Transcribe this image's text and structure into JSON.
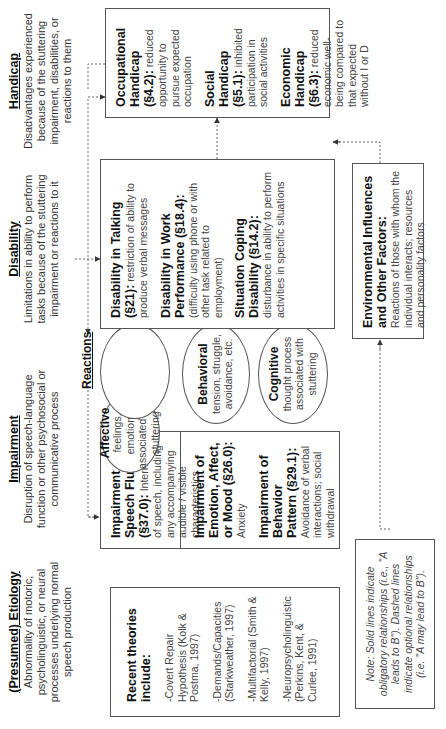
{
  "columns": {
    "etiology": {
      "title": "(Presumed) Etiology",
      "description": "Abnormality of motoric, psycholinguistic, or neural processes underlying normal speech production"
    },
    "impairment": {
      "title": "Impairment",
      "description": "Disruption of speech-language function or other psychosocial or communicative process"
    },
    "disability": {
      "title": "Disability",
      "description": "Limitations in ability to perform tasks because of the stuttering impairment or reactions to it"
    },
    "handicap": {
      "title": "Handicap",
      "description": "Disadvantages experienced because of the stuttering impairment, disabilities, or reactions to them"
    }
  },
  "theories": {
    "heading": "Recent theories include:",
    "items": [
      "-Covert Repair Hypothesis (Kolk & Postma, 1997)",
      "-Demands/Capacities (Starkweather, 1997)",
      "-Multifactorial (Smith & Kelly, 1997)",
      "-Neuropsycholinguistic (Perkins, Kent, & Curlee, 1991)"
    ]
  },
  "impairment_box": {
    "items": [
      {
        "title": "Impairment of Speech Fluency (§37.0):",
        "text": " Interruption of speech, including any accompanying audible / visible characteristics"
      },
      {
        "title": "Impairment of Emotion, Affect, or Mood (§26.0):",
        "text": " Anxiety"
      },
      {
        "title": "Impairment of Behavior Pattern (§29.1):",
        "text": " Avoidance of verbal interactions; social withdrawal"
      }
    ]
  },
  "reactions": {
    "label": "Reactions",
    "items": [
      {
        "title": "Affective",
        "text": "feelings, emotions associated with stuttering"
      },
      {
        "title": "Behavioral",
        "text": "tension, struggle, avoidance, etc."
      },
      {
        "title": "Cognitive",
        "text": "thought process associated with stuttering"
      }
    ]
  },
  "disability_box": {
    "items": [
      {
        "title": "Disability in Talking (§21):",
        "text": " restriction of ability to produce verbal messages"
      },
      {
        "title": "Disability in Work Performance (§18.4):",
        "text": " (difficulty using phone or with other task related to employment)"
      },
      {
        "title": "Situation Coping Disability (§14.2):",
        "text": " disturbance in ability to perform activities in specific situations"
      }
    ]
  },
  "handicap_box": {
    "items": [
      {
        "title": "Occupational Handicap (§4.2):",
        "text": " reduced opportunity to pursue expected occupation"
      },
      {
        "title": "Social Handicap (§5.1):",
        "text": " inhibited participation in social activities"
      },
      {
        "title": "Economic Handicap (§6.3):",
        "text": " reduced economic well-being compared to that expected without I or D"
      }
    ]
  },
  "environment": {
    "title": "Environmental Influences and Other Factors:",
    "text": " Reactions of those with whom the individual interacts; resources and personality factors"
  },
  "note": {
    "text": "Note: Solid lines indicate obligatory relationships (i.e., \"A leads to B\"). Dashed lines indicate optional relationships (i.e. \"A may lead to B\")."
  },
  "colors": {
    "line": "#555555",
    "text": "#222222",
    "background": "#ffffff"
  }
}
